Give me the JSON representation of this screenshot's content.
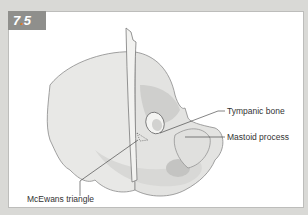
{
  "figure": {
    "number_major": "7",
    "number_dot": ".",
    "number_minor": "5",
    "accent_color": "#e07b2a"
  },
  "labels": {
    "tympanic_bone": "Tympanic bone",
    "mastoid_process": "Mastoid process",
    "mcewans_triangle": "McEwans triangle"
  }
}
